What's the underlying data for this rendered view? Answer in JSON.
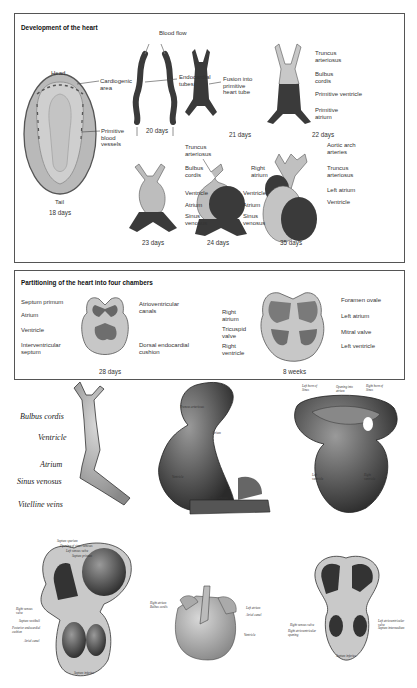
{
  "panel1": {
    "title": "Development of the heart",
    "embryo": {
      "head": "Head",
      "tail": "Tail",
      "age": "18 days",
      "cardiogenic": "Cardiogenic\narea",
      "vessels": "Primitive\nblood\nvessels"
    },
    "d20": {
      "blood_flow": "Blood flow",
      "endocardial": "Endocardial\ntubes",
      "age": "20 days"
    },
    "d21": {
      "fusion": "Fusion into\nprimitive\nheart tube",
      "age": "21 days"
    },
    "d22": {
      "truncus": "Truncus\narteriosus",
      "bulbus": "Bulbus\ncordis",
      "ventricle": "Primitive ventricle",
      "atrium": "Primitive\natrium",
      "age": "22 days"
    },
    "d23": {
      "truncus": "Truncus\narteriosus",
      "bulbus": "Bulbus\ncordis",
      "ventricle": "Ventricle",
      "atrium": "Atrium",
      "sinus": "Sinus\nvenosus",
      "age": "23 days"
    },
    "d24": {
      "ventricle": "Ventricle",
      "atrium": "Atrium",
      "sinus": "Sinus\nvenosus",
      "age": "24 days"
    },
    "d35": {
      "aortic": "Aortic arch\narteries",
      "right_atrium": "Right\natrium",
      "truncus": "Truncus\narteriosus",
      "left_atrium": "Left atrium",
      "ventricle": "Ventricle",
      "age": "35 days"
    }
  },
  "panel2": {
    "title": "Partitioning of the heart into four chambers",
    "d28": {
      "septum_primum": "Septum primum",
      "atrium": "Atrium",
      "ventricle": "Ventricle",
      "iv_septum": "Interventricular\nseptum",
      "av_canals": "Atrioventricular\ncanals",
      "cushion": "Dorsal endocardial\ncushion",
      "age": "28 days"
    },
    "w8": {
      "right_atrium": "Right\natrium",
      "tricuspid": "Tricuspid\nvalve",
      "right_ventricle": "Right\nventricle",
      "foramen": "Foramen ovale",
      "left_atrium": "Left atrium",
      "mitral": "Mitral valve",
      "left_ventricle": "Left ventricle",
      "age": "8 weeks"
    }
  },
  "engravings": {
    "tube": {
      "bulbus": "Bulbus cordis",
      "ventricle": "Ventricle",
      "atrium": "Atrium",
      "sinus": "Sinus venosus",
      "vitelline": "Vitelline veins"
    },
    "loop": {
      "truncus": "Truncus arteriosus",
      "atrium": "Atrium",
      "ventricle": "Ventricle",
      "sinus": "Sinus venosus"
    },
    "cut": {
      "left_horn": "Left horn of\nSinus",
      "opening": "Opening into\natrium",
      "right_horn": "Right horn of\nSinus",
      "lv": "Left\nventricle",
      "rv": "Right\nventricle"
    },
    "interior": {
      "septum_spurium": "Septum spurium",
      "opening_sinus": "Opening of sinus venosus",
      "left_valve": "Left venous valve",
      "septum_primum": "Septum primum",
      "right_valve": "Right venous\nvalve",
      "septum_vestibule": "Septum vestibuli",
      "cushion": "Posterior endocardial\ncushion",
      "canal": "Atrial canal",
      "septum_inferius": "Septum inferius"
    },
    "external": {
      "right_atrium": "Right atrium",
      "bulbus": "Bulbus cordis",
      "left_atrium": "Left atrium",
      "canal": "Atrial canal",
      "ventricle": "Ventricle"
    },
    "section": {
      "left_valve": "Left atrioventricular\nvalve",
      "septum": "Septum intermedium",
      "right_valve": "Right venous valve",
      "right_av": "Right atrioventricular\nopening",
      "septum_inf": "Septum inferius"
    }
  }
}
